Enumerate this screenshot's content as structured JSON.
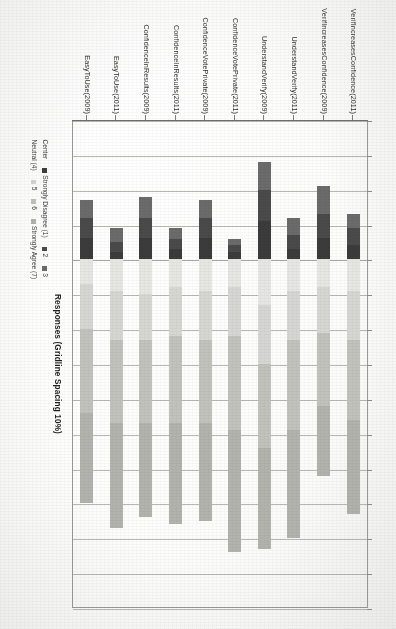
{
  "figure": {
    "axis_title": "Responses (Gridline Spacing 10%)",
    "gridline_spacing_percent": 10
  },
  "legend": {
    "row1": [
      {
        "label": "Center",
        "swatch": "none"
      },
      {
        "label": "Strongly Disagree (1)",
        "swatch": "#3b3b3b"
      },
      {
        "label": "2",
        "swatch": "#4a4a4a"
      },
      {
        "label": "3",
        "swatch": "#6b6b6b"
      }
    ],
    "row2": [
      {
        "label": "Neutral (4)",
        "swatch": "none"
      },
      {
        "label": "5",
        "swatch": "#d6d6d2"
      },
      {
        "label": "6",
        "swatch": "#c2c2bd"
      },
      {
        "label": "Strongly Agree (7)",
        "swatch": "#b3b3ae"
      }
    ]
  },
  "chart_data": {
    "type": "bar",
    "subtype": "diverging-stacked-likert",
    "title": "",
    "xlabel": "Responses (Gridline Spacing 10%)",
    "ylabel": "",
    "orientation": "horizontal",
    "grid": true,
    "gridline_spacing_percent": 10,
    "xlim": [
      -40,
      100
    ],
    "legend_position": "below",
    "categories": [
      "VerifIncreasesConfidence(2011)",
      "VerifIncreasesConfidence(2009)",
      "UnderstandVerify(2011)",
      "UnderstandVerify(2009)",
      "ConfidenceVotePrivate(2011)",
      "ConfidenceVotePrivate(2009)",
      "ConfidenceInResults(2011)",
      "ConfidenceInResults(2009)",
      "EasyToUse(2011)",
      "EasyToUse(2009)"
    ],
    "series": [
      {
        "name": "Strongly Disagree (1)",
        "color": "#3b3b3b",
        "side": "negative",
        "values": [
          4,
          6,
          3,
          11,
          2,
          6,
          3,
          6,
          2,
          6
        ]
      },
      {
        "name": "2",
        "color": "#4a4a4a",
        "side": "negative",
        "values": [
          5,
          7,
          4,
          9,
          2,
          6,
          3,
          6,
          3,
          6
        ]
      },
      {
        "name": "3",
        "color": "#6b6b6b",
        "side": "negative",
        "values": [
          4,
          8,
          5,
          8,
          2,
          5,
          3,
          6,
          4,
          5
        ]
      },
      {
        "name": "Neutral (4)",
        "color": "#e6e6e3",
        "side": "positive",
        "values": [
          9,
          8,
          9,
          13,
          8,
          9,
          8,
          10,
          9,
          7
        ]
      },
      {
        "name": "5",
        "color": "#d6d6d2",
        "side": "positive",
        "values": [
          14,
          13,
          14,
          17,
          14,
          14,
          14,
          13,
          14,
          13
        ]
      },
      {
        "name": "6",
        "color": "#c2c2bd",
        "side": "positive",
        "values": [
          23,
          21,
          26,
          24,
          27,
          24,
          25,
          24,
          24,
          24
        ]
      },
      {
        "name": "Strongly Agree (7)",
        "color": "#b3b3ae",
        "side": "positive",
        "values": [
          27,
          20,
          31,
          29,
          35,
          28,
          29,
          27,
          30,
          26
        ]
      }
    ]
  },
  "bars": [
    {
      "name": "VerifIncreasesConfidence(2011)",
      "neg": [
        {
          "v": 4,
          "c": "#6b6b6b"
        },
        {
          "v": 5,
          "c": "#4a4a4a"
        },
        {
          "v": 4,
          "c": "#3b3b3b"
        }
      ],
      "pos": [
        {
          "v": 9,
          "c": "#e6e6e3"
        },
        {
          "v": 14,
          "c": "#d6d6d2"
        },
        {
          "v": 23,
          "c": "#c2c2bd"
        },
        {
          "v": 27,
          "c": "#b3b3ae"
        }
      ]
    },
    {
      "name": "VerifIncreasesConfidence(2009)",
      "neg": [
        {
          "v": 8,
          "c": "#6b6b6b"
        },
        {
          "v": 7,
          "c": "#4a4a4a"
        },
        {
          "v": 6,
          "c": "#3b3b3b"
        }
      ],
      "pos": [
        {
          "v": 8,
          "c": "#e6e6e3"
        },
        {
          "v": 13,
          "c": "#d6d6d2"
        },
        {
          "v": 21,
          "c": "#c2c2bd"
        },
        {
          "v": 20,
          "c": "#b3b3ae"
        }
      ]
    },
    {
      "name": "UnderstandVerify(2011)",
      "neg": [
        {
          "v": 5,
          "c": "#6b6b6b"
        },
        {
          "v": 4,
          "c": "#4a4a4a"
        },
        {
          "v": 3,
          "c": "#3b3b3b"
        }
      ],
      "pos": [
        {
          "v": 9,
          "c": "#e6e6e3"
        },
        {
          "v": 14,
          "c": "#d6d6d2"
        },
        {
          "v": 26,
          "c": "#c2c2bd"
        },
        {
          "v": 31,
          "c": "#b3b3ae"
        }
      ]
    },
    {
      "name": "UnderstandVerify(2009)",
      "neg": [
        {
          "v": 8,
          "c": "#6b6b6b"
        },
        {
          "v": 9,
          "c": "#4a4a4a"
        },
        {
          "v": 11,
          "c": "#3b3b3b"
        }
      ],
      "pos": [
        {
          "v": 13,
          "c": "#e6e6e3"
        },
        {
          "v": 17,
          "c": "#d6d6d2"
        },
        {
          "v": 24,
          "c": "#c2c2bd"
        },
        {
          "v": 29,
          "c": "#b3b3ae"
        }
      ]
    },
    {
      "name": "ConfidenceVotePrivate(2011)",
      "neg": [
        {
          "v": 2,
          "c": "#6b6b6b"
        },
        {
          "v": 2,
          "c": "#4a4a4a"
        },
        {
          "v": 2,
          "c": "#3b3b3b"
        }
      ],
      "pos": [
        {
          "v": 8,
          "c": "#e6e6e3"
        },
        {
          "v": 14,
          "c": "#d6d6d2"
        },
        {
          "v": 27,
          "c": "#c2c2bd"
        },
        {
          "v": 35,
          "c": "#b3b3ae"
        }
      ]
    },
    {
      "name": "ConfidenceVotePrivate(2009)",
      "neg": [
        {
          "v": 5,
          "c": "#6b6b6b"
        },
        {
          "v": 6,
          "c": "#4a4a4a"
        },
        {
          "v": 6,
          "c": "#3b3b3b"
        }
      ],
      "pos": [
        {
          "v": 9,
          "c": "#e6e6e3"
        },
        {
          "v": 14,
          "c": "#d6d6d2"
        },
        {
          "v": 24,
          "c": "#c2c2bd"
        },
        {
          "v": 28,
          "c": "#b3b3ae"
        }
      ]
    },
    {
      "name": "ConfidenceInResults(2011)",
      "neg": [
        {
          "v": 3,
          "c": "#6b6b6b"
        },
        {
          "v": 3,
          "c": "#4a4a4a"
        },
        {
          "v": 3,
          "c": "#3b3b3b"
        }
      ],
      "pos": [
        {
          "v": 8,
          "c": "#e6e6e3"
        },
        {
          "v": 14,
          "c": "#d6d6d2"
        },
        {
          "v": 25,
          "c": "#c2c2bd"
        },
        {
          "v": 29,
          "c": "#b3b3ae"
        }
      ]
    },
    {
      "name": "ConfidenceInResults(2009)",
      "neg": [
        {
          "v": 6,
          "c": "#6b6b6b"
        },
        {
          "v": 6,
          "c": "#4a4a4a"
        },
        {
          "v": 6,
          "c": "#3b3b3b"
        }
      ],
      "pos": [
        {
          "v": 10,
          "c": "#e6e6e3"
        },
        {
          "v": 13,
          "c": "#d6d6d2"
        },
        {
          "v": 24,
          "c": "#c2c2bd"
        },
        {
          "v": 27,
          "c": "#b3b3ae"
        }
      ]
    },
    {
      "name": "EasyToUse(2011)",
      "neg": [
        {
          "v": 4,
          "c": "#6b6b6b"
        },
        {
          "v": 3,
          "c": "#4a4a4a"
        },
        {
          "v": 2,
          "c": "#3b3b3b"
        }
      ],
      "pos": [
        {
          "v": 9,
          "c": "#e6e6e3"
        },
        {
          "v": 14,
          "c": "#d6d6d2"
        },
        {
          "v": 24,
          "c": "#c2c2bd"
        },
        {
          "v": 30,
          "c": "#b3b3ae"
        }
      ]
    },
    {
      "name": "EasyToUse(2009)",
      "neg": [
        {
          "v": 5,
          "c": "#6b6b6b"
        },
        {
          "v": 6,
          "c": "#4a4a4a"
        },
        {
          "v": 6,
          "c": "#3b3b3b"
        }
      ],
      "pos": [
        {
          "v": 7,
          "c": "#e6e6e3"
        },
        {
          "v": 13,
          "c": "#d6d6d2"
        },
        {
          "v": 24,
          "c": "#c2c2bd"
        },
        {
          "v": 26,
          "c": "#b3b3ae"
        }
      ]
    }
  ]
}
